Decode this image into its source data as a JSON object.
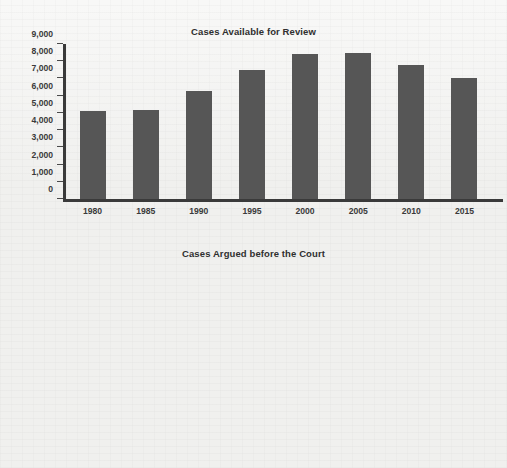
{
  "page": {
    "background_color": "#f0f0ee",
    "text_color": "#3a3a3a"
  },
  "charts": {
    "top": {
      "title": "Cases Available for Review",
      "bar_color": "#565656",
      "axis_color": "#3a3a3a"
    },
    "bottom": {
      "title": "Cases Argued before the Court",
      "bar_color": "#8a8a8a",
      "axis_color": "#3a3a3a"
    }
  },
  "chart_data": [
    {
      "type": "bar",
      "id": "cases-available-for-review",
      "title": "Cases Available for Review",
      "xlabel": "",
      "ylabel": "",
      "categories": [
        "1980",
        "1985",
        "1990",
        "1995",
        "2000",
        "2005",
        "2010",
        "2015"
      ],
      "values": [
        5100,
        5150,
        6300,
        7500,
        8400,
        8500,
        7800,
        7000
      ],
      "ylim": [
        0,
        9000
      ],
      "ytick_values": [
        0,
        1000,
        2000,
        3000,
        4000,
        5000,
        6000,
        7000,
        8000,
        9000
      ],
      "ytick_labels": [
        "0",
        "1,000",
        "2,000",
        "3,000",
        "4,000",
        "5,000",
        "6,000",
        "7,000",
        "8,000",
        "9,000"
      ],
      "grid": false,
      "legend": null,
      "bar_color": "#565656"
    },
    {
      "type": "bar",
      "id": "cases-argued-before-the-court",
      "title": "Cases Argued before the Court",
      "xlabel": "",
      "ylabel": "",
      "categories": [
        "1980",
        "1985",
        "1990",
        "1995",
        "2000",
        "2005",
        "2010",
        "2015"
      ],
      "values": [
        155,
        172,
        125,
        90,
        72,
        87,
        85,
        74
      ],
      "ylim": [
        0,
        180
      ],
      "ytick_values": [
        0,
        20,
        40,
        60,
        80,
        100,
        120,
        140,
        160,
        180
      ],
      "ytick_labels": [
        "0",
        "20",
        "40",
        "60",
        "80",
        "100",
        "120",
        "140",
        "160",
        "180"
      ],
      "grid": false,
      "legend": null,
      "bar_color": "#8a8a8a"
    }
  ]
}
